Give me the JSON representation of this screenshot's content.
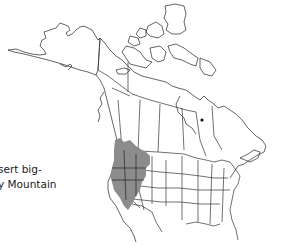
{
  "map": {
    "title": "North America species range map",
    "region_shown": "North America (Alaska, Canada, contiguous United States, northern Mexico)",
    "range_color": "#8c8c8c",
    "range_description": "Western United States: Great Basin and Rocky Mountain region, extending into southern British Columbia/Alberta",
    "point_marker": "isolated occurrence dot in northern Ontario/Quebec"
  },
  "legend": {
    "line1": "sert big-",
    "line2": "y Mountain"
  },
  "colors": {
    "background": "#ffffff",
    "range_fill": "#8c8c8c",
    "outline": "#222222"
  }
}
